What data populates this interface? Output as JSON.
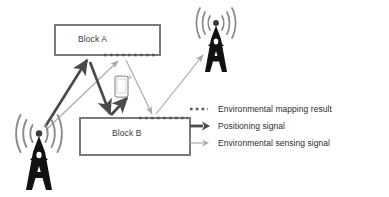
{
  "diagram": {
    "type": "wireless-positioning-and-environment-sensing-schematic",
    "blocks": [
      {
        "id": "block_a",
        "label": "Block A",
        "x": 55,
        "y": 25,
        "w": 105,
        "h": 30
      },
      {
        "id": "block_b",
        "label": "Block B",
        "x": 80,
        "y": 118,
        "w": 110,
        "h": 37
      }
    ],
    "towers": [
      {
        "id": "tower_left",
        "name": "base-station-tower-left",
        "x": 39,
        "y": 160
      },
      {
        "id": "tower_right",
        "name": "base-station-tower-right",
        "x": 216,
        "y": 40
      }
    ],
    "devices": [
      {
        "id": "user_phone",
        "name": "smartphone-user-equipment",
        "x": 121,
        "y": 88
      }
    ]
  },
  "colors": {
    "block_border": "#7a7a7a",
    "block_label": "#3a3a3a",
    "mapping_dotted": "#585858",
    "positioning_arrow": "#4a4a4a",
    "sensing_arrow": "#a8a8a8",
    "tower_fill": "#111111",
    "wave_stroke": "#8a8a8a",
    "phone_stroke": "#909090",
    "background": "#ffffff"
  },
  "legend": {
    "items": [
      {
        "id": "mapping",
        "marker": "dotted-line-marker",
        "label": "Environmental mapping result",
        "color": "#585858"
      },
      {
        "id": "positioning",
        "marker": "thick-arrow-marker",
        "label": "Positioning signal",
        "color": "#4a4a4a"
      },
      {
        "id": "sensing",
        "marker": "thin-arrow-marker",
        "label": "Environmental sensing signal",
        "color": "#a8a8a8"
      }
    ]
  }
}
